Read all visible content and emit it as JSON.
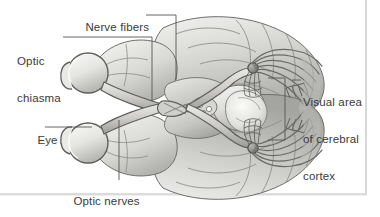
{
  "figure": {
    "background_color": "#ffffff",
    "label_color": "#3a3a3a",
    "leader_line_color": "#555555",
    "frame_edge_color": "#d8d8d8"
  },
  "labels": {
    "nerve_fibers": "Nerve fibers",
    "optic_chiasma_line1": "Optic",
    "optic_chiasma_line2": "chiasma",
    "visual_area_line1": "Visual area",
    "visual_area_line2": "of cerebral",
    "visual_area_line3": "cortex",
    "eye": "Eye",
    "optic_nerves": "Optic nerves"
  },
  "structures": [
    {
      "name": "eye-left",
      "label": "Eye"
    },
    {
      "name": "eye-right",
      "label": "Eye"
    },
    {
      "name": "optic-nerve-left",
      "label": "Optic nerves"
    },
    {
      "name": "optic-nerve-right",
      "label": "Optic nerves"
    },
    {
      "name": "optic-chiasma",
      "label": "Optic chiasma"
    },
    {
      "name": "optic-tract",
      "label": "Nerve fibers"
    },
    {
      "name": "lateral-geniculate-body",
      "label": "Nerve fibers"
    },
    {
      "name": "optic-radiation",
      "label": "Nerve fibers"
    },
    {
      "name": "occipital-cortex",
      "label": "Visual area of cerebral cortex"
    },
    {
      "name": "brainstem",
      "label": "Brain stem"
    },
    {
      "name": "cerebral-hemisphere",
      "label": "Cerebral hemisphere"
    }
  ],
  "palette": {
    "brain_light": "#e8e8e6",
    "brain_mid": "#c9c9c6",
    "brain_dark": "#a6a6a3",
    "brain_shadow": "#8a8a88",
    "outline": "#6d6d6b",
    "eye_fill": "#ededea",
    "nerve_fill": "#d2d2cf"
  }
}
